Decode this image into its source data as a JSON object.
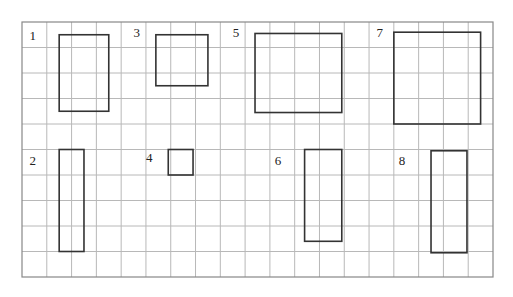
{
  "grid": {
    "cols": 19,
    "rows": 10,
    "line_color": "#b8b8b8",
    "border_color": "#888888"
  },
  "shape_color": "#333333",
  "figures": [
    {
      "label": "1",
      "label_cell": [
        0.3,
        0.7
      ],
      "rect": [
        1.5,
        0.5,
        2,
        3
      ]
    },
    {
      "label": "2",
      "label_cell": [
        0.3,
        5.6
      ],
      "rect": [
        1.5,
        5.0,
        1,
        4
      ]
    },
    {
      "label": "3",
      "label_cell": [
        4.5,
        0.6
      ],
      "rect": [
        5.4,
        0.5,
        2.1,
        2
      ]
    },
    {
      "label": "4",
      "label_cell": [
        5.0,
        5.5
      ],
      "rect": [
        5.9,
        5.0,
        1,
        1
      ]
    },
    {
      "label": "5",
      "label_cell": [
        8.5,
        0.6
      ],
      "rect": [
        9.4,
        0.45,
        3.5,
        3.1
      ]
    },
    {
      "label": "6",
      "label_cell": [
        10.2,
        5.6
      ],
      "rect": [
        11.4,
        5.0,
        1.5,
        3.6
      ]
    },
    {
      "label": "7",
      "label_cell": [
        14.3,
        0.6
      ],
      "rect": [
        15.0,
        0.4,
        3.5,
        3.6
      ]
    },
    {
      "label": "8",
      "label_cell": [
        15.2,
        5.6
      ],
      "rect": [
        16.5,
        5.05,
        1.45,
        4.0
      ]
    }
  ]
}
